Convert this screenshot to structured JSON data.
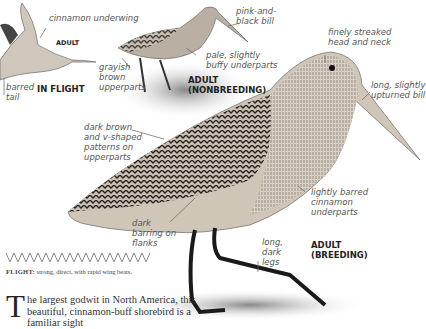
{
  "illustrations": {
    "flight": {
      "caption_age": "ADULT",
      "caption_pose": "IN FLIGHT",
      "labels": [
        "cinnamon underwing",
        "barred tail"
      ]
    },
    "nonbreeding": {
      "caption": "ADULT (NONBREEDING)",
      "labels": [
        "pink-and-black bill",
        "grayish brown upperparts",
        "pale, slightly buffy underparts"
      ]
    },
    "breeding": {
      "caption": "ADULT (BREEDING)",
      "labels": [
        "finely streaked head and neck",
        "long, slightly upturned bill",
        "dark brown and v-shaped patterns on upperparts",
        "lightly barred cinnamon underparts",
        "dark barring on flanks",
        "long, dark legs"
      ]
    }
  },
  "flight": {
    "label": "FLIGHT:",
    "text": " strong, direct, with rapid wing beats."
  },
  "intro": {
    "dropcap": "T",
    "text": "he largest godwit in North America, this beautiful, cinnamon-buff shorebird is a familiar sight"
  }
}
